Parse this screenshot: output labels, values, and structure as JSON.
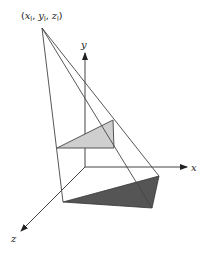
{
  "diagram": {
    "light_point_label": "(x_l, y_l, z_l)",
    "light_point_text": {
      "open": "(",
      "x": "x",
      "xs": "l",
      "y": "y",
      "ys": "l",
      "z": "z",
      "zs": "l",
      "close": ")"
    },
    "axes": {
      "x_label": "x",
      "y_label": "y",
      "z_label": "z"
    },
    "colors": {
      "line": "#444444",
      "object_fill": "#cfcfcf",
      "shadow_fill": "#555555",
      "axis": "#333333"
    },
    "geometry": {
      "apex": [
        42,
        28
      ],
      "origin": [
        85,
        167
      ],
      "y_axis_tip": [
        85,
        52
      ],
      "x_axis_tip": [
        188,
        167
      ],
      "z_axis_tip": [
        20,
        232
      ],
      "object_triangle": [
        [
          57,
          148
        ],
        [
          114,
          148
        ],
        [
          113,
          120
        ]
      ],
      "shadow_triangle": [
        [
          63,
          202
        ],
        [
          152,
          208
        ],
        [
          159,
          176
        ]
      ]
    },
    "elements": [
      {
        "name": "light-source-point",
        "description": "Point light at (xl, yl, zl)"
      },
      {
        "name": "object-triangle",
        "description": "Light gray triangle above the ground plane"
      },
      {
        "name": "shadow-triangle",
        "description": "Dark gray projected shadow on the y=0 plane"
      },
      {
        "name": "projection-rays",
        "description": "Rays from light point through object vertices to shadow vertices"
      }
    ]
  }
}
